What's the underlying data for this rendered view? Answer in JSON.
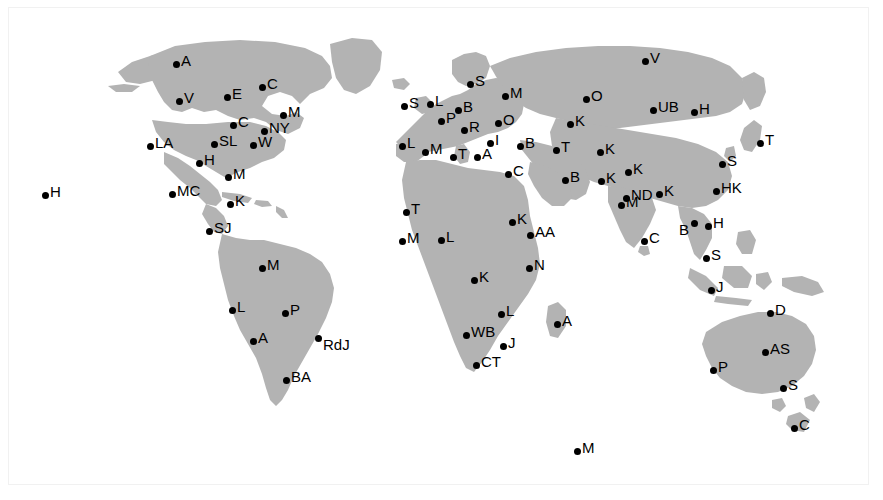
{
  "page": {
    "width": 883,
    "height": 500,
    "background_color": "#ffffff",
    "land_color": "#b3b3b3",
    "marker_color": "#000000",
    "label_color": "#000000",
    "frame_color": "#f1f1f1"
  },
  "map": {
    "projection": "equirectangular",
    "marker_count": 82,
    "regions": [
      "North America",
      "South America",
      "Europe",
      "Africa",
      "Asia",
      "Oceania",
      "Antarctica"
    ]
  },
  "markers": [
    {
      "label": "H",
      "x": 45,
      "y": 195,
      "side": "pos-r",
      "region": "Pacific"
    },
    {
      "label": "A",
      "x": 176,
      "y": 64,
      "side": "pos-r",
      "region": "North America"
    },
    {
      "label": "V",
      "x": 179,
      "y": 101,
      "side": "pos-r",
      "region": "North America"
    },
    {
      "label": "E",
      "x": 227,
      "y": 97,
      "side": "pos-r",
      "region": "North America"
    },
    {
      "label": "C",
      "x": 262,
      "y": 87,
      "side": "pos-r",
      "region": "North America"
    },
    {
      "label": "M",
      "x": 283,
      "y": 115,
      "side": "pos-r",
      "region": "North America"
    },
    {
      "label": "C",
      "x": 233,
      "y": 125,
      "side": "pos-r",
      "region": "North America"
    },
    {
      "label": "NY",
      "x": 264,
      "y": 131,
      "side": "pos-r",
      "region": "North America"
    },
    {
      "label": "SL",
      "x": 214,
      "y": 144,
      "side": "pos-r",
      "region": "North America"
    },
    {
      "label": "W",
      "x": 253,
      "y": 145,
      "side": "pos-r",
      "region": "North America"
    },
    {
      "label": "LA",
      "x": 150,
      "y": 146,
      "side": "pos-r",
      "region": "North America"
    },
    {
      "label": "H",
      "x": 199,
      "y": 163,
      "side": "pos-r",
      "region": "North America"
    },
    {
      "label": "M",
      "x": 228,
      "y": 177,
      "side": "pos-r",
      "region": "North America"
    },
    {
      "label": "MC",
      "x": 172,
      "y": 194,
      "side": "pos-r",
      "region": "North America"
    },
    {
      "label": "K",
      "x": 230,
      "y": 204,
      "side": "pos-r",
      "region": "North America"
    },
    {
      "label": "SJ",
      "x": 209,
      "y": 231,
      "side": "pos-r",
      "region": "North America"
    },
    {
      "label": "M",
      "x": 262,
      "y": 268,
      "side": "pos-r",
      "region": "South America"
    },
    {
      "label": "L",
      "x": 232,
      "y": 310,
      "side": "pos-r",
      "region": "South America"
    },
    {
      "label": "P",
      "x": 285,
      "y": 313,
      "side": "pos-r",
      "region": "South America"
    },
    {
      "label": "A",
      "x": 253,
      "y": 341,
      "side": "pos-r",
      "region": "South America"
    },
    {
      "label": "RdJ",
      "x": 318,
      "y": 338,
      "side": "pos-rb",
      "region": "South America"
    },
    {
      "label": "BA",
      "x": 286,
      "y": 380,
      "side": "pos-r",
      "region": "South America"
    },
    {
      "label": "S",
      "x": 470,
      "y": 84,
      "side": "pos-r",
      "region": "Europe"
    },
    {
      "label": "S",
      "x": 404,
      "y": 106,
      "side": "pos-r",
      "region": "Europe"
    },
    {
      "label": "L",
      "x": 430,
      "y": 104,
      "side": "pos-r",
      "region": "Europe"
    },
    {
      "label": "B",
      "x": 458,
      "y": 110,
      "side": "pos-r",
      "region": "Europe"
    },
    {
      "label": "P",
      "x": 441,
      "y": 121,
      "side": "pos-r",
      "region": "Europe"
    },
    {
      "label": "R",
      "x": 464,
      "y": 130,
      "side": "pos-r",
      "region": "Europe"
    },
    {
      "label": "M",
      "x": 505,
      "y": 96,
      "side": "pos-r",
      "region": "Europe"
    },
    {
      "label": "O",
      "x": 498,
      "y": 123,
      "side": "pos-r",
      "region": "Europe"
    },
    {
      "label": "L",
      "x": 402,
      "y": 146,
      "side": "pos-r",
      "region": "Europe"
    },
    {
      "label": "M",
      "x": 425,
      "y": 152,
      "side": "pos-r",
      "region": "Europe"
    },
    {
      "label": "T",
      "x": 453,
      "y": 157,
      "side": "pos-r",
      "region": "Europe"
    },
    {
      "label": "A",
      "x": 477,
      "y": 157,
      "side": "pos-r",
      "region": "Europe"
    },
    {
      "label": "I",
      "x": 490,
      "y": 143,
      "side": "pos-r",
      "region": "Europe"
    },
    {
      "label": "C",
      "x": 508,
      "y": 174,
      "side": "pos-r",
      "region": "Europe"
    },
    {
      "label": "B",
      "x": 520,
      "y": 146,
      "side": "pos-r",
      "region": "Europe"
    },
    {
      "label": "T",
      "x": 556,
      "y": 150,
      "side": "pos-r",
      "region": "Europe"
    },
    {
      "label": "O",
      "x": 586,
      "y": 99,
      "side": "pos-r",
      "region": "Europe"
    },
    {
      "label": "K",
      "x": 570,
      "y": 124,
      "side": "pos-r",
      "region": "Europe"
    },
    {
      "label": "B",
      "x": 565,
      "y": 180,
      "side": "pos-r",
      "region": "Middle East"
    },
    {
      "label": "K",
      "x": 600,
      "y": 152,
      "side": "pos-r",
      "region": "Middle East"
    },
    {
      "label": "K",
      "x": 601,
      "y": 181,
      "side": "pos-r",
      "region": "Middle East"
    },
    {
      "label": "T",
      "x": 406,
      "y": 212,
      "side": "pos-r",
      "region": "Africa"
    },
    {
      "label": "M",
      "x": 402,
      "y": 241,
      "side": "pos-r",
      "region": "Africa"
    },
    {
      "label": "L",
      "x": 441,
      "y": 240,
      "side": "pos-r",
      "region": "Africa"
    },
    {
      "label": "K",
      "x": 512,
      "y": 222,
      "side": "pos-r",
      "region": "Africa"
    },
    {
      "label": "AA",
      "x": 530,
      "y": 235,
      "side": "pos-r",
      "region": "Africa"
    },
    {
      "label": "K",
      "x": 474,
      "y": 280,
      "side": "pos-r",
      "region": "Africa"
    },
    {
      "label": "N",
      "x": 529,
      "y": 268,
      "side": "pos-r",
      "region": "Africa"
    },
    {
      "label": "L",
      "x": 501,
      "y": 314,
      "side": "pos-r",
      "region": "Africa"
    },
    {
      "label": "WB",
      "x": 466,
      "y": 335,
      "side": "pos-r",
      "region": "Africa"
    },
    {
      "label": "A",
      "x": 557,
      "y": 324,
      "side": "pos-r",
      "region": "Africa"
    },
    {
      "label": "J",
      "x": 503,
      "y": 346,
      "side": "pos-r",
      "region": "Africa"
    },
    {
      "label": "CT",
      "x": 476,
      "y": 365,
      "side": "pos-r",
      "region": "Africa"
    },
    {
      "label": "V",
      "x": 645,
      "y": 61,
      "side": "pos-r",
      "region": "Asia"
    },
    {
      "label": "UB",
      "x": 653,
      "y": 110,
      "side": "pos-r",
      "region": "Asia"
    },
    {
      "label": "H",
      "x": 694,
      "y": 112,
      "side": "pos-r",
      "region": "Asia"
    },
    {
      "label": "K",
      "x": 628,
      "y": 172,
      "side": "pos-r",
      "region": "Asia"
    },
    {
      "label": "T",
      "x": 760,
      "y": 143,
      "side": "pos-r",
      "region": "Asia"
    },
    {
      "label": "S",
      "x": 722,
      "y": 164,
      "side": "pos-r",
      "region": "Asia"
    },
    {
      "label": "HK",
      "x": 716,
      "y": 191,
      "side": "pos-r",
      "region": "Asia"
    },
    {
      "label": "ND",
      "x": 626,
      "y": 198,
      "side": "pos-r",
      "region": "Asia"
    },
    {
      "label": "K",
      "x": 659,
      "y": 194,
      "side": "pos-r",
      "region": "Asia"
    },
    {
      "label": "M",
      "x": 621,
      "y": 205,
      "side": "pos-r",
      "region": "Asia"
    },
    {
      "label": "C",
      "x": 644,
      "y": 241,
      "side": "pos-r",
      "region": "Asia"
    },
    {
      "label": "B",
      "x": 694,
      "y": 223,
      "side": "pos-lb",
      "region": "Asia"
    },
    {
      "label": "H",
      "x": 708,
      "y": 226,
      "side": "pos-r",
      "region": "Asia"
    },
    {
      "label": "S",
      "x": 706,
      "y": 258,
      "side": "pos-r",
      "region": "Asia"
    },
    {
      "label": "J",
      "x": 711,
      "y": 290,
      "side": "pos-r",
      "region": "Asia"
    },
    {
      "label": "D",
      "x": 770,
      "y": 313,
      "side": "pos-r",
      "region": "Oceania"
    },
    {
      "label": "AS",
      "x": 765,
      "y": 352,
      "side": "pos-r",
      "region": "Oceania"
    },
    {
      "label": "P",
      "x": 713,
      "y": 370,
      "side": "pos-r",
      "region": "Oceania"
    },
    {
      "label": "S",
      "x": 783,
      "y": 388,
      "side": "pos-r",
      "region": "Oceania"
    },
    {
      "label": "C",
      "x": 794,
      "y": 428,
      "side": "pos-r",
      "region": "Oceania"
    },
    {
      "label": "M",
      "x": 577,
      "y": 451,
      "side": "pos-r",
      "region": "Antarctica"
    }
  ]
}
